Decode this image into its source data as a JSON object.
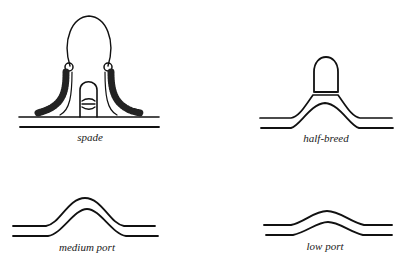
{
  "figure": {
    "type": "mouthpiece-illustrations",
    "ink_color": "#111111",
    "background": "#ffffff",
    "panels": [
      {
        "id": "spade",
        "label": "spade",
        "position": "top-left"
      },
      {
        "id": "half-breed",
        "label": "half-breed",
        "position": "top-right"
      },
      {
        "id": "medium-port",
        "label": "medium port",
        "position": "bottom-left"
      },
      {
        "id": "low-port",
        "label": "low port",
        "position": "bottom-right"
      }
    ]
  }
}
